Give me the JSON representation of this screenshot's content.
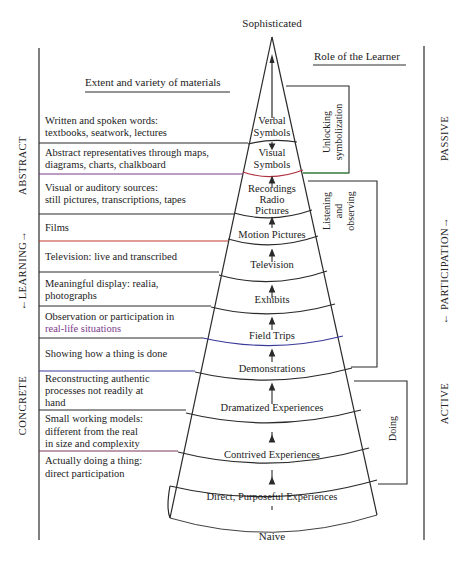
{
  "title_top": "Sophisticated",
  "title_bottom": "Naive",
  "header_left": "Extent and variety of materials",
  "header_right": "Role of the Learner",
  "left_axis": {
    "top_label": "ABSTRACT",
    "middle_label": "←LEARNING→",
    "bottom_label": "CONCRETE"
  },
  "right_axis": {
    "top_label": "PASSIVE",
    "middle_label": "← PARTICIPATION→",
    "bottom_label": "ACTIVE"
  },
  "brackets": {
    "unlocking": [
      "Unlocking",
      "symbolization"
    ],
    "listening": [
      "Listening",
      "and",
      "observing"
    ],
    "doing": "Doing"
  },
  "cone_levels": [
    {
      "label": [
        "Verbal",
        "Symbols"
      ]
    },
    {
      "label": [
        "Visual",
        "Symbols"
      ]
    },
    {
      "label": [
        "Recordings",
        "Radio",
        "Pictures"
      ]
    },
    {
      "label": [
        "Motion Pictures"
      ]
    },
    {
      "label": [
        "Television"
      ]
    },
    {
      "label": [
        "Exhibits"
      ]
    },
    {
      "label": [
        "Field Trips"
      ]
    },
    {
      "label": [
        "Demonstrations"
      ]
    },
    {
      "label": [
        "Dramatized Experiences"
      ]
    },
    {
      "label": [
        "Contrived Experiences"
      ]
    },
    {
      "label": [
        "Direct, Purposeful Experiences"
      ]
    }
  ],
  "materials": [
    {
      "lines": [
        "Written and spoken words:",
        "textbooks, seatwork, lectures"
      ]
    },
    {
      "lines": [
        "Abstract representatives through maps,",
        "diagrams, charts, chalkboard"
      ]
    },
    {
      "lines": [
        "Visual or auditory sources:",
        "still pictures, transcriptions, tapes"
      ]
    },
    {
      "lines": [
        "Films"
      ]
    },
    {
      "lines": [
        "Television: live and transcribed"
      ]
    },
    {
      "lines": [
        "Meaningful display: realia,",
        "photographs"
      ]
    },
    {
      "lines": [
        "Observation or participation in",
        "real-life situations"
      ]
    },
    {
      "lines": [
        "Showing how a thing is done"
      ]
    },
    {
      "lines": [
        "Reconstructing authentic",
        "processes not readily at",
        "hand"
      ]
    },
    {
      "lines": [
        "Small working models:",
        "different from the real",
        "in size and complexity"
      ]
    },
    {
      "lines": [
        "Actually doing a thing:",
        "direct participation"
      ]
    }
  ],
  "colors": {
    "line": "#2a2a2a",
    "accent_red": "#c0392b",
    "accent_green": "#3aa040",
    "accent_purple": "#7a3a8a",
    "accent_blue": "#3a3a9a"
  }
}
